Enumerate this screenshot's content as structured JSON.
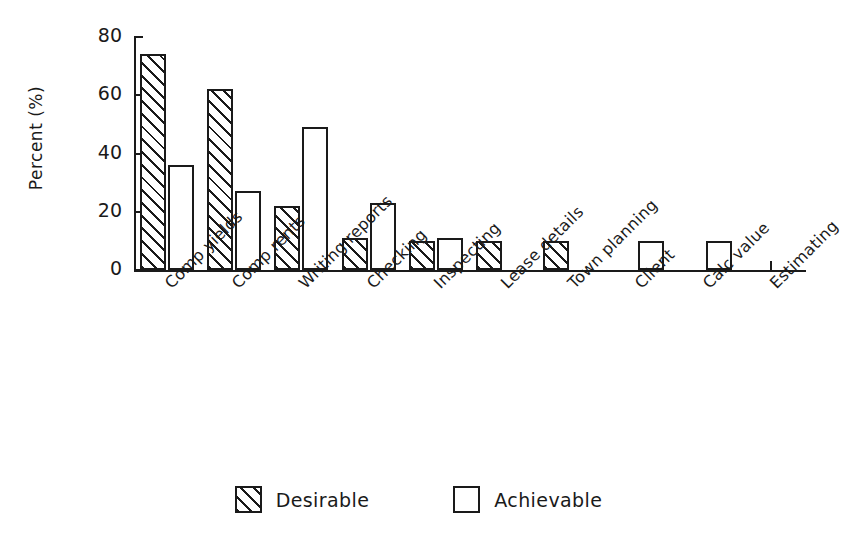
{
  "chart_data": {
    "type": "bar",
    "title": "",
    "xlabel": "",
    "ylabel": "Percent (%)",
    "ylim": [
      0,
      80
    ],
    "yticks": [
      0,
      20,
      40,
      60,
      80
    ],
    "grid": false,
    "legend_position": "bottom-center",
    "categories": [
      "Comp yields",
      "Comp rents",
      "Writing reports",
      "Checking",
      "Inspecting",
      "Lease details",
      "Town planning",
      "Client",
      "Calc value",
      "Estimating"
    ],
    "series": [
      {
        "name": "Desirable",
        "style": "hatched",
        "values": [
          74,
          62,
          22,
          11,
          10,
          10,
          10,
          0,
          0,
          0
        ]
      },
      {
        "name": "Achievable",
        "style": "open",
        "values": [
          36,
          27,
          49,
          23,
          11,
          0,
          0,
          10,
          10,
          0
        ]
      }
    ]
  },
  "axis": {
    "y_title": "Percent (%)",
    "y_tick_labels": [
      "0",
      "20",
      "40",
      "60",
      "80"
    ]
  },
  "legend": {
    "items": [
      {
        "label": "Desirable",
        "swatch": "hatched-square-icon"
      },
      {
        "label": "Achievable",
        "swatch": "open-square-icon"
      }
    ]
  },
  "colors": {
    "ink": "#1a1a1a",
    "background": "#ffffff"
  }
}
